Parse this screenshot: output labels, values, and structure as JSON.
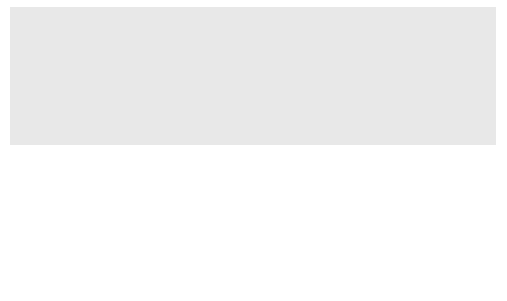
{
  "diagram": {
    "root": {
      "label": "Control"
    },
    "level1": [
      {
        "label": "Input and output"
      },
      {
        "label": "Validation"
      },
      {
        "label": "Control processing"
      },
      {
        "label": "Set up reports"
      }
    ],
    "level2": [
      {
        "label": "Processing Type 1"
      },
      {
        "label": "Processing Type 2"
      }
    ],
    "colors": {
      "node_fill": "#d9d9d9",
      "node_border": "#4d4d4d",
      "frame": "#e8e8e8",
      "card": "#ffffff"
    }
  }
}
